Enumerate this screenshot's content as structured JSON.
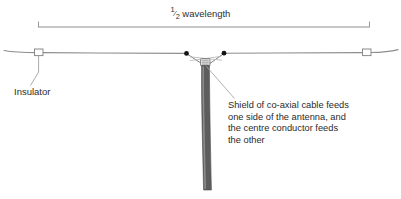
{
  "diagram": {
    "background_color": "#ffffff",
    "wire_color": "#8a8a8a",
    "cable_color": "#585858",
    "cable_highlight_color": "#9a9a9a",
    "node_color": "#1a1a1a",
    "text_color": "#2b2b2b",
    "dimension": {
      "fraction": "1/2",
      "numerator": "1",
      "denominator": "2",
      "label": "wavelength",
      "full_label": "1/2 wavelength"
    },
    "labels": {
      "insulator": "Insulator",
      "feed_note_line1": "Shield of co-axial cable feeds",
      "feed_note_line2": "one side of the antenna, and",
      "feed_note_line3": "the centre conductor feeds",
      "feed_note_line4": "the other"
    },
    "parts": {
      "left_insulator": "insulator",
      "right_insulator": "insulator",
      "left_feed_point": "feed-point",
      "right_feed_point": "feed-point",
      "centre_connector": "centre-connector",
      "coaxial_cable": "coaxial-cable"
    }
  }
}
